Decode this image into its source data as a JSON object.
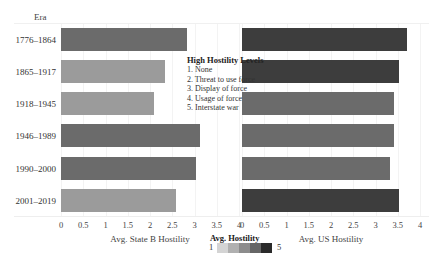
{
  "chart_data": {
    "type": "bar",
    "orientation": "horizontal",
    "title": "",
    "row_header": "Era",
    "categories": [
      "1776–1864",
      "1865–1917",
      "1918–1945",
      "1946–1989",
      "1990–2000",
      "2001–2019"
    ],
    "panels": [
      {
        "name": "Avg. State B Hostility",
        "xlabel": "Avg. State B Hostility",
        "xlim": [
          0,
          4
        ],
        "ticks": [
          "0",
          "0.5",
          "1",
          "1.5",
          "2",
          "2.5",
          "3",
          "3.5",
          "4"
        ],
        "values": [
          2.83,
          2.34,
          2.09,
          3.12,
          3.03,
          2.58
        ],
        "color_level": [
          4,
          3,
          3,
          4,
          4,
          3
        ]
      },
      {
        "name": "Avg. US Hostility",
        "xlabel": "Avg. US Hostility",
        "xlim": [
          0,
          4
        ],
        "ticks": [
          "0",
          "0.5",
          "1",
          "1.5",
          "2",
          "2.5",
          "3",
          "3.5",
          "4"
        ],
        "values": [
          3.7,
          3.52,
          3.42,
          3.42,
          3.33,
          3.52
        ],
        "color_level": [
          5,
          5,
          4,
          4,
          4,
          5
        ]
      }
    ],
    "color_legend": {
      "title": "Avg. Hostility",
      "min_label": "1",
      "max_label": "5",
      "colors": [
        "#d4d4d4",
        "#b0b0b0",
        "#8c8c8c",
        "#666666",
        "#2a2a2a"
      ]
    },
    "annotation": {
      "title": "High Hostility Levels",
      "items": [
        "1. None",
        "2. Threat to use force",
        "3. Display of force",
        "4. Usage of force",
        "5. Interstate war"
      ]
    },
    "grid": true,
    "legend_position": "bottom-center"
  },
  "bar_colors": {
    "3": "#9b9b9b",
    "4": "#6b6b6b",
    "5": "#3d3d3d"
  }
}
